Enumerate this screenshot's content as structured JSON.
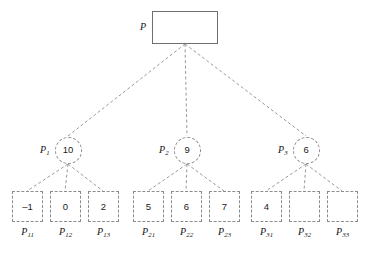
{
  "figure": {
    "type": "tree-diagram",
    "colors": {
      "root_border": "#6f6f72",
      "dashed_border": "#8d8d90",
      "edge": "#9a9a9d",
      "text": "#1b1b1b",
      "background": "#ffffff"
    }
  },
  "root": {
    "label": "P",
    "label_sub": "",
    "value": "",
    "shape": "rectangle",
    "x": 152,
    "y": 11,
    "width": 66,
    "height": 33,
    "label_x": 140,
    "label_y": 22
  },
  "internal_nodes": [
    {
      "label": "P",
      "label_sub": "1",
      "value": "10",
      "shape": "circle",
      "cx": 68,
      "cy": 150,
      "r": 13.5,
      "label_x": 40,
      "label_y": 145
    },
    {
      "label": "P",
      "label_sub": "2",
      "value": "9",
      "shape": "circle",
      "cx": 187,
      "cy": 150,
      "r": 13.5,
      "label_x": 159,
      "label_y": 145
    },
    {
      "label": "P",
      "label_sub": "3",
      "value": "6",
      "shape": "circle",
      "cx": 306,
      "cy": 150,
      "r": 13.5,
      "label_x": 278,
      "label_y": 145
    }
  ],
  "leaf_nodes": [
    {
      "label": "P",
      "label_sub": "11",
      "value": "–1",
      "x": 12,
      "parent": 0
    },
    {
      "label": "P",
      "label_sub": "12",
      "value": "0",
      "x": 50,
      "parent": 0
    },
    {
      "label": "P",
      "label_sub": "13",
      "value": "2",
      "x": 88,
      "parent": 0
    },
    {
      "label": "P",
      "label_sub": "21",
      "value": "5",
      "x": 133,
      "parent": 1
    },
    {
      "label": "P",
      "label_sub": "22",
      "value": "6",
      "x": 171,
      "parent": 1
    },
    {
      "label": "P",
      "label_sub": "23",
      "value": "7",
      "x": 209,
      "parent": 1
    },
    {
      "label": "P",
      "label_sub": "31",
      "value": "4",
      "x": 251,
      "parent": 2
    },
    {
      "label": "P",
      "label_sub": "32",
      "value": "",
      "x": 289,
      "parent": 2
    },
    {
      "label": "P",
      "label_sub": "33",
      "value": "",
      "x": 327,
      "parent": 2
    }
  ],
  "edges": [
    {
      "from": "root",
      "to": "P1",
      "x1": 185,
      "y1": 44,
      "x2": 68,
      "y2": 136
    },
    {
      "from": "root",
      "to": "P2",
      "x1": 185,
      "y1": 44,
      "x2": 187,
      "y2": 136
    },
    {
      "from": "root",
      "to": "P3",
      "x1": 185,
      "y1": 44,
      "x2": 306,
      "y2": 136
    },
    {
      "from": "P1",
      "to": "P11",
      "x1": 68,
      "y1": 164,
      "x2": 27,
      "y2": 191
    },
    {
      "from": "P1",
      "to": "P12",
      "x1": 68,
      "y1": 164,
      "x2": 65,
      "y2": 191
    },
    {
      "from": "P1",
      "to": "P13",
      "x1": 68,
      "y1": 164,
      "x2": 103,
      "y2": 191
    },
    {
      "from": "P2",
      "to": "P21",
      "x1": 187,
      "y1": 164,
      "x2": 148,
      "y2": 191
    },
    {
      "from": "P2",
      "to": "P22",
      "x1": 187,
      "y1": 164,
      "x2": 186,
      "y2": 191
    },
    {
      "from": "P2",
      "to": "P23",
      "x1": 187,
      "y1": 164,
      "x2": 224,
      "y2": 191
    },
    {
      "from": "P3",
      "to": "P31",
      "x1": 306,
      "y1": 164,
      "x2": 266,
      "y2": 191
    },
    {
      "from": "P3",
      "to": "P32",
      "x1": 306,
      "y1": 164,
      "x2": 304,
      "y2": 191
    },
    {
      "from": "P3",
      "to": "P33",
      "x1": 306,
      "y1": 164,
      "x2": 342,
      "y2": 191
    }
  ]
}
